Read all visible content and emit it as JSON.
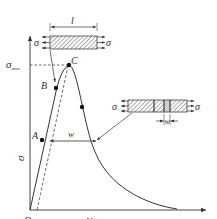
{
  "figure": {
    "type": "stress-displacement diagram (strain softening / localization)",
    "axes": {
      "y_label": "σ",
      "x_label": "Δl",
      "origin_label": "O"
    },
    "peak_label": "σ",
    "peak_subscript": "max",
    "points": [
      {
        "label": "A"
      },
      {
        "label": "B"
      },
      {
        "label": "C"
      }
    ],
    "dimension_labels": {
      "specimen_length": "l",
      "band_width_curve": "w",
      "band_width_specimen": "w"
    },
    "specimen_top": {
      "stress_left": "σ",
      "stress_right": "σ"
    },
    "specimen_right": {
      "stress_left": "σ",
      "stress_right": "σ"
    },
    "colors": {
      "line": "#333333",
      "hatch": "#555555",
      "axis": "#444444"
    }
  }
}
